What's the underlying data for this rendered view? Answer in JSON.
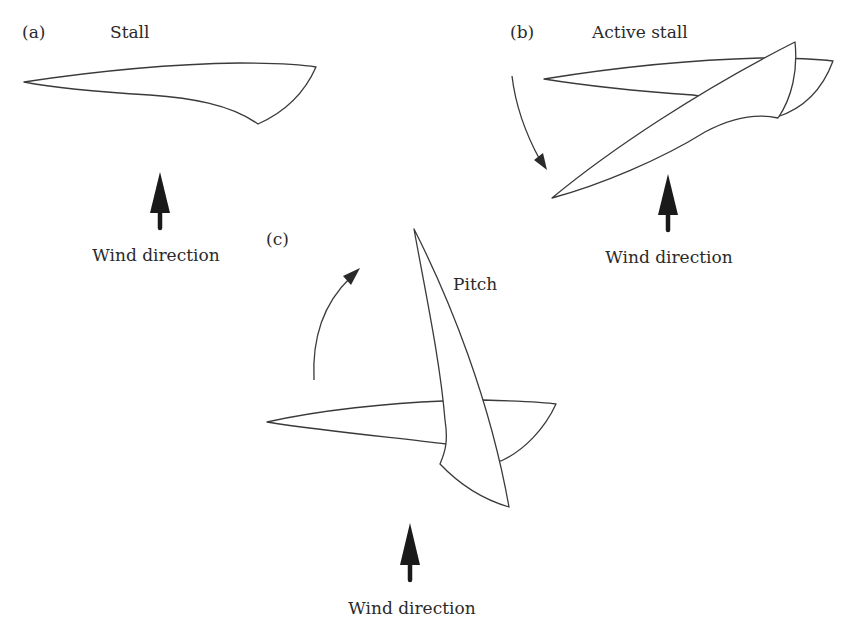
{
  "figure": {
    "panels": [
      {
        "id": "a",
        "label": "(a)",
        "title": "Stall",
        "wind_label": "Wind direction"
      },
      {
        "id": "b",
        "label": "(b)",
        "title": "Active stall",
        "wind_label": "Wind direction"
      },
      {
        "id": "c",
        "label": "(c)",
        "title": "Pitch",
        "wind_label": "Wind direction"
      }
    ]
  },
  "colors": {
    "outline": "#3a3a3a",
    "arrow_fill": "#1a1a1a",
    "background": "#ffffff"
  }
}
